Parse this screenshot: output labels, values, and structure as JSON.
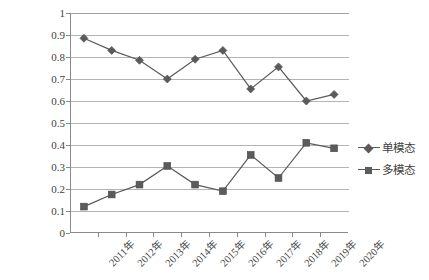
{
  "chart_data": {
    "type": "line",
    "title": "",
    "subtitle": "",
    "xlabel": "",
    "ylabel": "",
    "ylim": [
      0,
      1
    ],
    "ytick_labels": [
      "1",
      "0.9",
      "0.8",
      "0.7",
      "0.6",
      "0.5",
      "0.4",
      "0.3",
      "0.2",
      "0.1",
      "0"
    ],
    "ytick_values": [
      1,
      0.9,
      0.8,
      0.7,
      0.6,
      0.5,
      0.4,
      0.3,
      0.2,
      0.1,
      0
    ],
    "grid": true,
    "legend_position": "right",
    "categories": [
      "2011年",
      "2012年",
      "2013年",
      "2014年",
      "2015年",
      "2016年",
      "2017年",
      "2018年",
      "2019年",
      "2020年"
    ],
    "series": [
      {
        "name": "单模态",
        "marker": "diamond",
        "color": "#5b5b5b",
        "values": [
          0.885,
          0.83,
          0.785,
          0.7,
          0.79,
          0.83,
          0.655,
          0.755,
          0.6,
          0.63
        ]
      },
      {
        "name": "多模态",
        "marker": "square",
        "color": "#5b5b5b",
        "values": [
          0.12,
          0.175,
          0.22,
          0.305,
          0.22,
          0.19,
          0.355,
          0.25,
          0.41,
          0.385
        ]
      }
    ],
    "annotations": []
  },
  "legend": {
    "items": [
      {
        "label": "单模态",
        "marker": "diamond-marker"
      },
      {
        "label": "多模态",
        "marker": "square-marker"
      }
    ]
  }
}
